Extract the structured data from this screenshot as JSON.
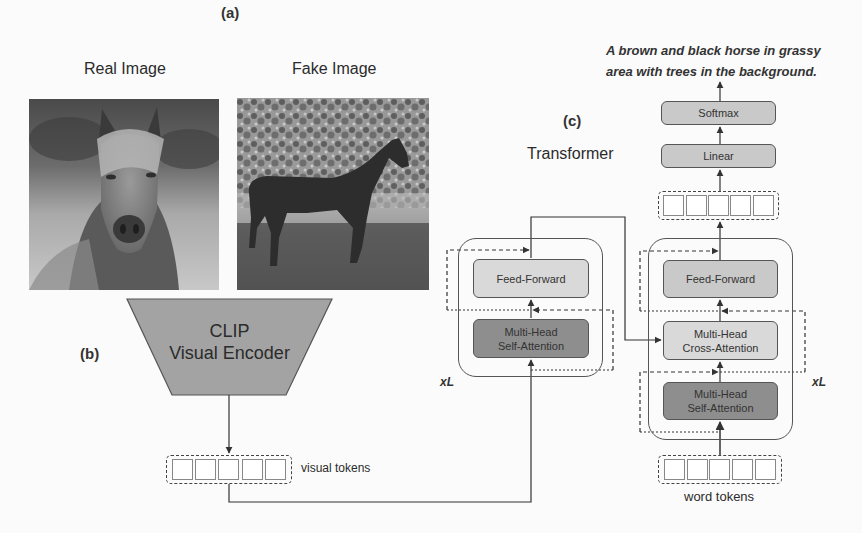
{
  "figure": {
    "panel_a": {
      "tag": "(a)",
      "real_image_label": "Real Image",
      "fake_image_label": "Fake Image"
    },
    "panel_b": {
      "tag": "(b)",
      "encoder_line1": "CLIP",
      "encoder_line2": "Visual Encoder",
      "visual_tokens_label": "visual tokens",
      "token_count": 5
    },
    "panel_c": {
      "tag": "(c)",
      "title": "Transformer",
      "output_caption_line1": "A brown and black horse in grassy",
      "output_caption_line2": "area with trees in the background.",
      "encoder": {
        "feed_forward": "Feed-Forward",
        "self_attention_line1": "Multi-Head",
        "self_attention_line2": "Self-Attention",
        "repeat": "xL"
      },
      "decoder": {
        "feed_forward": "Feed-Forward",
        "cross_attention_line1": "Multi-Head",
        "cross_attention_line2": "Cross-Attention",
        "self_attention_line1": "Multi-Head",
        "self_attention_line2": "Self-Attention",
        "repeat": "xL"
      },
      "linear": "Linear",
      "softmax": "Softmax",
      "word_tokens_label": "word tokens"
    }
  },
  "colors": {
    "block_light": "#c9c9c9",
    "block_lighter": "#d9d9d9",
    "block_dark": "#8e8e8e",
    "encoder_trapezoid": "#a3a3a3",
    "line": "#333333"
  }
}
